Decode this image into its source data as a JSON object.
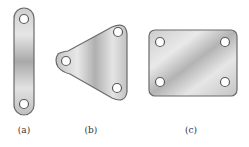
{
  "figure": {
    "colors": {
      "plate_fill_light": "#ececec",
      "plate_fill_mid": "#bdbdbd",
      "plate_fill_dark": "#9a9a9a",
      "plate_outline": "#6a6a6a",
      "hole_fill": "#ffffff",
      "hole_outline": "#5a5a5a",
      "label_color": "#333333"
    },
    "panels": [
      {
        "id": "a",
        "label": "(a)",
        "shape": "link-bar",
        "holes": 2
      },
      {
        "id": "b",
        "label": "(b)",
        "shape": "rounded-triangle",
        "holes": 3
      },
      {
        "id": "c",
        "label": "(c)",
        "shape": "rounded-rectangle",
        "holes": 4
      }
    ]
  }
}
